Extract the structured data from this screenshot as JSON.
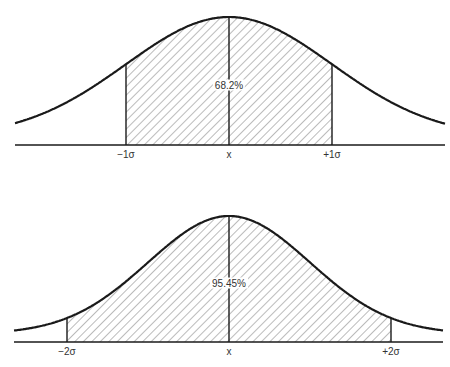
{
  "charts": [
    {
      "name": "one-sigma",
      "percent_label": "68.2%",
      "labels": {
        "left": "−1σ",
        "center": "x",
        "right": "+1σ"
      },
      "geometry": {
        "mean_x": 229,
        "sigma_px": 103,
        "base_y": 145,
        "peak_y": 17,
        "x_start": 15,
        "x_end": 445,
        "shade_k": 1
      }
    },
    {
      "name": "two-sigma",
      "percent_label": "95.45%",
      "labels": {
        "left": "−2σ",
        "center": "x",
        "right": "+2σ"
      },
      "geometry": {
        "mean_x": 229,
        "sigma_px": 81,
        "base_y": 342,
        "peak_y": 216,
        "x_start": 14,
        "x_end": 443,
        "shade_k": 2
      }
    }
  ],
  "chart_data": [
    {
      "type": "area",
      "title": "Normal distribution: ±1σ",
      "x_ticks": [
        "−1σ",
        "x",
        "+1σ"
      ],
      "shaded_range": [
        -1,
        1
      ],
      "annotation": "68.2%",
      "grid": false
    },
    {
      "type": "area",
      "title": "Normal distribution: ±2σ",
      "x_ticks": [
        "−2σ",
        "x",
        "+2σ"
      ],
      "shaded_range": [
        -2,
        2
      ],
      "annotation": "95.45%",
      "grid": false
    }
  ],
  "colors": {
    "ink": "#1a1a1a",
    "hatch": "#555555",
    "background": "#ffffff"
  }
}
